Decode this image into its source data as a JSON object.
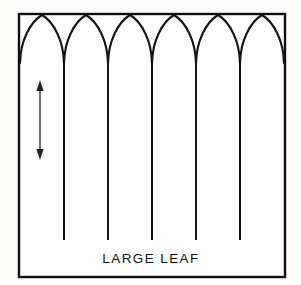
{
  "figure": {
    "caption": "LARGE LEAF",
    "background_color": "#fdfdfc",
    "ink_color": "#141414",
    "frame": {
      "x": 19,
      "y": 14,
      "width": 266,
      "height": 263,
      "stroke_color": "#111111"
    },
    "caption_position": {
      "x": 151,
      "y": 263
    },
    "arches": {
      "count": 6,
      "peak_y": 15,
      "valley_y": 63,
      "peak_x_positions": [
        42,
        86,
        130,
        174,
        218,
        262
      ],
      "valley_x_positions": [
        20,
        64,
        108,
        152,
        196,
        240,
        284
      ]
    },
    "veins": {
      "count": 5,
      "top_y": 63,
      "bottom_y": 240,
      "x_positions": [
        64,
        108,
        152,
        196,
        240
      ]
    },
    "measure_arrow": {
      "label": "leaf-length-measure",
      "x": 40,
      "top_y": 82,
      "bottom_y": 158,
      "double_headed": true,
      "color": "#222222"
    }
  }
}
